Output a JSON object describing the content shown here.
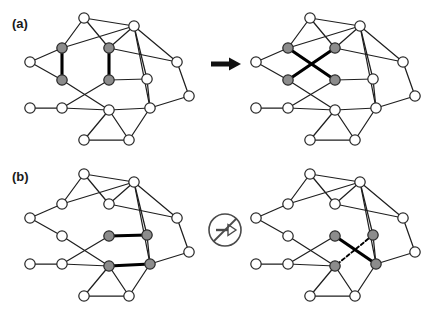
{
  "figure": {
    "background_color": "#ffffff",
    "panels": [
      {
        "id": "a",
        "label": "(a)",
        "operator": {
          "name": "arrow-right",
          "symbol": "→",
          "meaning": "allowed-double-edge-swap",
          "color": "#111111"
        },
        "left_graph": {
          "name": "graph-before",
          "highlighted_edges_style": "two parallel bold vertical edges",
          "marked_node_count": 4
        },
        "right_graph": {
          "name": "graph-after",
          "highlighted_edges_style": "two crossing bold diagonal edges",
          "marked_node_count": 4
        }
      },
      {
        "id": "b",
        "label": "(b)",
        "operator": {
          "name": "prohibited-arrow",
          "symbol": "⊘",
          "meaning": "forbidden-double-edge-swap",
          "color": "#3a3a3a"
        },
        "left_graph": {
          "name": "graph-before",
          "highlighted_edges_style": "two parallel bold horizontal edges",
          "marked_node_count": 4
        },
        "right_graph": {
          "name": "graph-after",
          "highlighted_edges_style": "one bold solid diagonal edge and one dashed diagonal edge crossing",
          "marked_node_count": 4
        }
      }
    ],
    "colors": {
      "node_fill_plain": "#ffffff",
      "node_fill_marked": "#8c8c8c",
      "node_stroke": "#2b2b2b",
      "edge": "#1f1f1f",
      "edge_bold": "#000000"
    },
    "node_radius": 5.2,
    "legend_note": ""
  },
  "chart_data": {
    "type": "diagram",
    "title": "",
    "nodes": {
      "layout_units": "panel-local pixels, panel box 190x150",
      "positions": [
        {
          "id": "n0",
          "x": 70,
          "y": 14
        },
        {
          "id": "n1",
          "x": 120,
          "y": 22
        },
        {
          "id": "n2",
          "x": 48,
          "y": 44
        },
        {
          "id": "n3",
          "x": 95,
          "y": 44
        },
        {
          "id": "n4",
          "x": 16,
          "y": 58
        },
        {
          "id": "n5",
          "x": 163,
          "y": 58
        },
        {
          "id": "n6",
          "x": 48,
          "y": 76
        },
        {
          "id": "n7",
          "x": 95,
          "y": 76
        },
        {
          "id": "n8",
          "x": 133,
          "y": 75
        },
        {
          "id": "n9",
          "x": 175,
          "y": 92
        },
        {
          "id": "n10",
          "x": 16,
          "y": 104
        },
        {
          "id": "n11",
          "x": 48,
          "y": 104
        },
        {
          "id": "n12",
          "x": 95,
          "y": 106
        },
        {
          "id": "n13",
          "x": 136,
          "y": 104
        },
        {
          "id": "n14",
          "x": 70,
          "y": 136
        },
        {
          "id": "n15",
          "x": 115,
          "y": 136
        }
      ],
      "base_edges": [
        [
          "n0",
          "n2"
        ],
        [
          "n0",
          "n3"
        ],
        [
          "n0",
          "n1"
        ],
        [
          "n1",
          "n2"
        ],
        [
          "n1",
          "n3"
        ],
        [
          "n1",
          "n5"
        ],
        [
          "n1",
          "n8"
        ],
        [
          "n1",
          "n13"
        ],
        [
          "n2",
          "n4"
        ],
        [
          "n3",
          "n5"
        ],
        [
          "n4",
          "n6"
        ],
        [
          "n5",
          "n9"
        ],
        [
          "n6",
          "n12"
        ],
        [
          "n7",
          "n8"
        ],
        [
          "n7",
          "n11"
        ],
        [
          "n8",
          "n13"
        ],
        [
          "n9",
          "n13"
        ],
        [
          "n10",
          "n11"
        ],
        [
          "n11",
          "n12"
        ],
        [
          "n12",
          "n13"
        ],
        [
          "n12",
          "n14"
        ],
        [
          "n12",
          "n15"
        ],
        [
          "n13",
          "n15"
        ],
        [
          "n14",
          "n15"
        ]
      ],
      "marked_nodes_panel_a": [
        "n2",
        "n3",
        "n6",
        "n7"
      ],
      "marked_nodes_panel_b": [
        "n7",
        "n8",
        "n12",
        "n13"
      ],
      "swap_edges_a_before": [
        [
          "n2",
          "n6"
        ],
        [
          "n3",
          "n7"
        ]
      ],
      "swap_edges_a_after": [
        [
          "n2",
          "n7"
        ],
        [
          "n3",
          "n6"
        ]
      ],
      "swap_edges_b_before": [
        [
          "n7",
          "n8"
        ],
        [
          "n12",
          "n13"
        ]
      ],
      "swap_edges_b_after_solid": [
        [
          "n7",
          "n13"
        ]
      ],
      "swap_edges_b_after_dashed": [
        [
          "n8",
          "n12"
        ]
      ]
    }
  }
}
